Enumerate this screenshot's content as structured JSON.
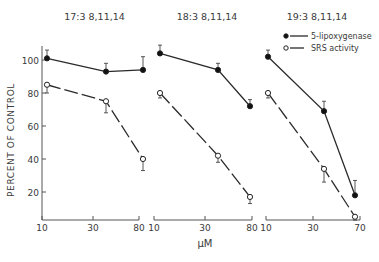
{
  "chart_data": {
    "type": "line",
    "ylabel": "PERCENT OF CONTROL",
    "xlabel": "μM",
    "yticks": [
      20,
      40,
      60,
      80,
      100
    ],
    "legend": {
      "position": "upper right (panel 3)",
      "entries": [
        {
          "name": "5-lipoxygenase",
          "marker": "filled-circle",
          "line": "solid"
        },
        {
          "name": "SRS activity",
          "marker": "open-circle",
          "line": "dashed"
        }
      ]
    },
    "grid": false,
    "panels": [
      {
        "title": "17:3 8,11,14",
        "xticks": [
          "10",
          "30",
          "80"
        ],
        "x": [
          "10",
          "30",
          "80"
        ],
        "series": [
          {
            "name": "5-lipoxygenase",
            "values": [
              101,
              93,
              94
            ],
            "err": [
              5,
              5,
              8
            ]
          },
          {
            "name": "SRS activity",
            "values": [
              85,
              75,
              40
            ],
            "err": [
              5,
              7,
              7
            ]
          }
        ]
      },
      {
        "title": "18:3 8,11,14",
        "xticks": [
          "10",
          "30",
          "80"
        ],
        "x": [
          "10",
          "30",
          "80"
        ],
        "series": [
          {
            "name": "5-lipoxygenase",
            "values": [
              104,
              94,
              72
            ],
            "err": [
              5,
              4,
              4
            ]
          },
          {
            "name": "SRS activity",
            "values": [
              80,
              42,
              17
            ],
            "err": [
              3,
              4,
              4
            ]
          }
        ]
      },
      {
        "title": "19:3 8,11,14",
        "xticks": [
          "10",
          "30",
          "70"
        ],
        "x": [
          "10",
          "30",
          "70"
        ],
        "series": [
          {
            "name": "5-lipoxygenase",
            "values": [
              102,
              69,
              18
            ],
            "err": [
              4,
              6,
              9
            ]
          },
          {
            "name": "SRS activity",
            "values": [
              80,
              34,
              5
            ],
            "err": [
              3,
              8,
              2
            ]
          }
        ]
      }
    ]
  },
  "layout": {
    "panel_px": [
      {
        "x0": 42,
        "x_ticks_px": [
          42,
          93,
          139
        ],
        "points_px": [
          47,
          106,
          143
        ]
      },
      {
        "x0": 154,
        "x_ticks_px": [
          154,
          205,
          252
        ],
        "points_px": [
          160,
          218,
          250
        ]
      },
      {
        "x0": 266,
        "x_ticks_px": [
          266,
          313,
          360
        ],
        "points_px": [
          268,
          324,
          355
        ]
      }
    ],
    "y_for_100": 60,
    "px_per_unit": 1.65,
    "x_axis_y": 220
  }
}
